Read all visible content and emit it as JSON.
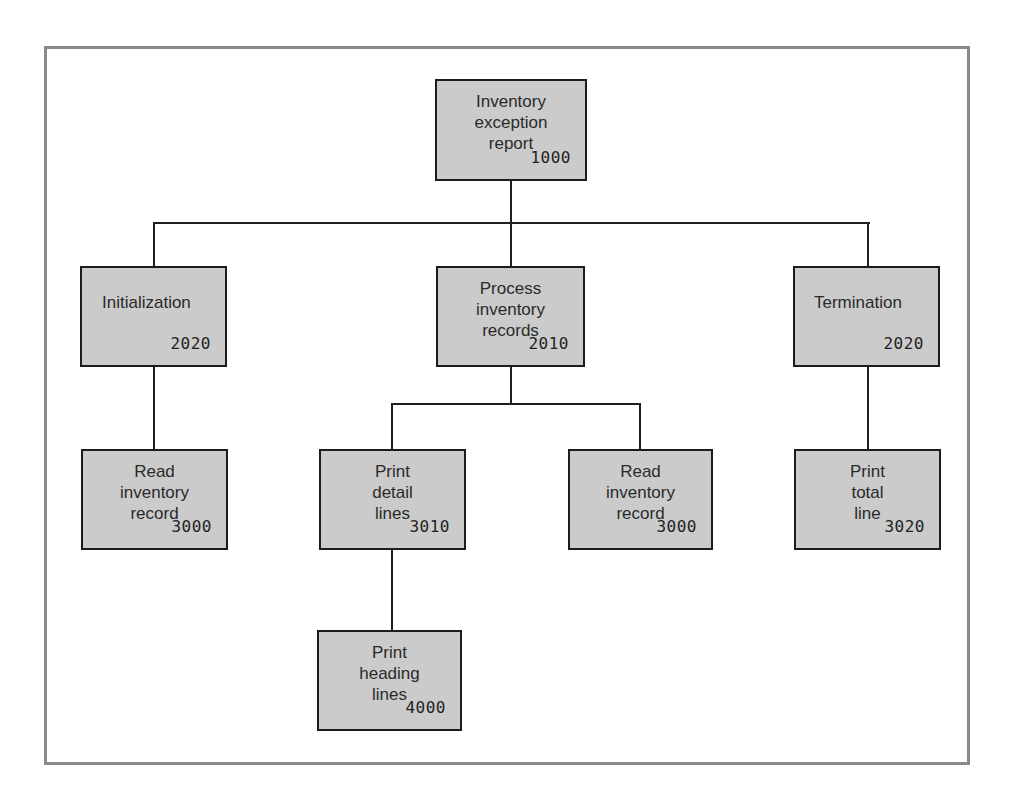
{
  "diagram": {
    "type": "structure-chart",
    "style": {
      "box_fill": "#cbcbcb",
      "box_border": "#1c1c1c",
      "line_color": "#1e1e1e",
      "frame_color": "#8a8a8a"
    },
    "nodes": {
      "root": {
        "label": "Inventory\nexception\nreport",
        "code": "1000"
      },
      "initialization": {
        "label": "Initialization",
        "code": "2020"
      },
      "process": {
        "label": "Process\ninventory\nrecords",
        "code": "2010"
      },
      "termination": {
        "label": "Termination",
        "code": "2020"
      },
      "read_left": {
        "label": "Read\ninventory\nrecord",
        "code": "3000"
      },
      "print_detail": {
        "label": "Print\ndetail\nlines",
        "code": "3010"
      },
      "read_right": {
        "label": "Read\ninventory\nrecord",
        "code": "3000"
      },
      "print_total": {
        "label": "Print\ntotal\nline",
        "code": "3020"
      },
      "print_heading": {
        "label": "Print\nheading\nlines",
        "code": "4000"
      }
    },
    "edges": [
      [
        "root",
        "initialization"
      ],
      [
        "root",
        "process"
      ],
      [
        "root",
        "termination"
      ],
      [
        "initialization",
        "read_left"
      ],
      [
        "process",
        "print_detail"
      ],
      [
        "process",
        "read_right"
      ],
      [
        "termination",
        "print_total"
      ],
      [
        "print_detail",
        "print_heading"
      ]
    ]
  }
}
